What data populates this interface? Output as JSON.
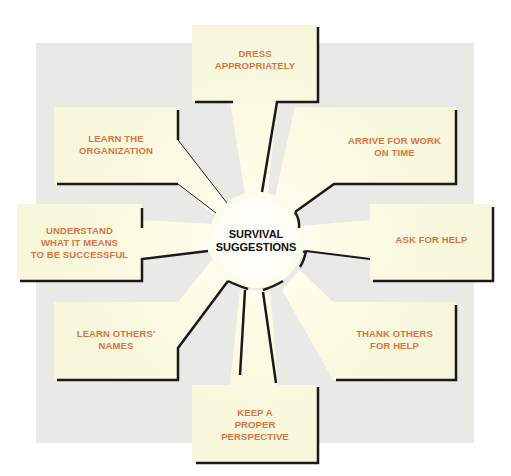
{
  "diagram": {
    "title": "SURVIVAL\nSUGGESTIONS",
    "colors": {
      "background_panel": "#e9e9e6",
      "box_fill": "#fdfcdc",
      "label_text": "#d9743f",
      "center_text": "#111111",
      "outline": "#1a1a1a"
    },
    "suggestions": [
      {
        "id": "dress",
        "label": "DRESS\nAPPROPRIATELY",
        "position": "top"
      },
      {
        "id": "arrive",
        "label": "ARRIVE FOR WORK\nON TIME",
        "position": "top-right"
      },
      {
        "id": "ask",
        "label": "ASK FOR HELP",
        "position": "right"
      },
      {
        "id": "thank",
        "label": "THANK OTHERS\nFOR HELP",
        "position": "bottom-right"
      },
      {
        "id": "perspective",
        "label": "KEEP A\nPROPER\nPERSPECTIVE",
        "position": "bottom"
      },
      {
        "id": "names",
        "label": "LEARN OTHERS'\nNAMES",
        "position": "bottom-left"
      },
      {
        "id": "understand",
        "label": "UNDERSTAND\nWHAT IT MEANS\nTO BE SUCCESSFUL",
        "position": "left"
      },
      {
        "id": "organization",
        "label": "LEARN THE\nORGANIZATION",
        "position": "top-left"
      }
    ]
  }
}
